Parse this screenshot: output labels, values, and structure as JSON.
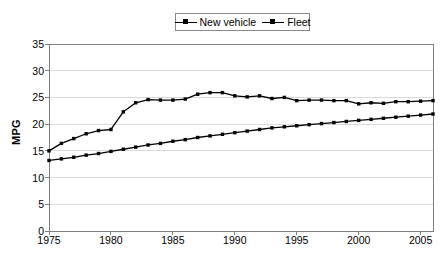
{
  "chart_data": {
    "type": "line",
    "title": "",
    "xlabel": "",
    "ylabel": "MPG",
    "xlim": [
      1975,
      2006
    ],
    "ylim": [
      0,
      35
    ],
    "yticks": [
      0,
      5,
      10,
      15,
      20,
      25,
      30,
      35
    ],
    "xticks": [
      1975,
      1980,
      1985,
      1990,
      1995,
      2000,
      2005
    ],
    "grid": "horizontal",
    "legend_position": "top-center",
    "marker": "square",
    "line_color": "#000000",
    "grid_color": "#d9d9d9",
    "axis_color": "#808080",
    "x": [
      1975,
      1976,
      1977,
      1978,
      1979,
      1980,
      1981,
      1982,
      1983,
      1984,
      1985,
      1986,
      1987,
      1988,
      1989,
      1990,
      1991,
      1992,
      1993,
      1994,
      1995,
      1996,
      1997,
      1998,
      1999,
      2000,
      2001,
      2002,
      2003,
      2004,
      2005,
      2006
    ],
    "series": [
      {
        "name": "New vehicle",
        "values": [
          15.0,
          16.4,
          17.3,
          18.2,
          18.8,
          19.0,
          22.3,
          24.0,
          24.6,
          24.5,
          24.5,
          24.7,
          25.6,
          25.9,
          25.9,
          25.3,
          25.1,
          25.3,
          24.8,
          25.0,
          24.4,
          24.5,
          24.5,
          24.4,
          24.4,
          23.8,
          24.0,
          23.9,
          24.2,
          24.2,
          24.3,
          24.4
        ]
      },
      {
        "name": "Fleet",
        "values": [
          13.2,
          13.5,
          13.8,
          14.2,
          14.5,
          14.9,
          15.3,
          15.7,
          16.1,
          16.4,
          16.8,
          17.1,
          17.5,
          17.8,
          18.1,
          18.4,
          18.7,
          19.0,
          19.3,
          19.5,
          19.7,
          19.9,
          20.1,
          20.3,
          20.5,
          20.7,
          20.9,
          21.1,
          21.3,
          21.5,
          21.7,
          21.9
        ]
      }
    ]
  },
  "legend": {
    "entries": [
      {
        "label": "New vehicle"
      },
      {
        "label": "Fleet"
      }
    ]
  },
  "axes": {
    "y_title": "MPG"
  }
}
